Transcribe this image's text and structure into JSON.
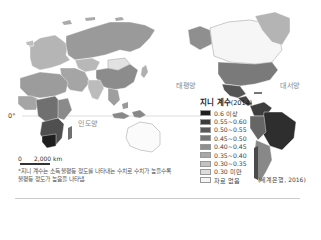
{
  "map": {
    "title": "지니 계수",
    "year": "(2014)",
    "equator_label": "0°",
    "oceans": {
      "indian": "인도양",
      "pacific": "태평양",
      "atlantic": "대서양"
    },
    "legend": [
      {
        "label": "0.6 이상",
        "color": "#1e1e1e"
      },
      {
        "label": "0.55~0.60",
        "color": "#3c3c3c"
      },
      {
        "label": "0.50~0.55",
        "color": "#595959"
      },
      {
        "label": "0.45~0.50",
        "color": "#757575"
      },
      {
        "label": "0.40~0.45",
        "color": "#8f8f8f"
      },
      {
        "label": "0.35~0.40",
        "color": "#a8a8a8"
      },
      {
        "label": "0.30~0.35",
        "color": "#c2c2c2"
      },
      {
        "label": "0.30 미만",
        "color": "#dcdcdc"
      },
      {
        "label": "자료 없음",
        "color": "#f4f4f4"
      }
    ],
    "scale": {
      "zero": "0",
      "distance": "2,000 km"
    },
    "footnote": "*지니 계수는 소득 불평등 정도를 나타내는 수치로 수치가 높을수록 불평등 정도가 높음을 나타냄.",
    "source": "(세계은행, 2016)"
  }
}
